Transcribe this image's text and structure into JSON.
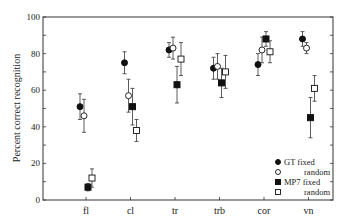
{
  "chart_data": {
    "type": "scatter",
    "title": "",
    "xlabel": "",
    "ylabel": "Percent correct recognition",
    "ylim": [
      0,
      100
    ],
    "yticks": [
      0,
      20,
      40,
      60,
      80,
      100
    ],
    "grid": false,
    "legend_position": "lower right",
    "categories": [
      "fl",
      "cl",
      "tr",
      "trb",
      "cor",
      "vn"
    ],
    "series": [
      {
        "name": "GT fixed",
        "marker": "filled-circle",
        "values": [
          51,
          75,
          82,
          72,
          74,
          88
        ],
        "err": [
          7,
          6,
          4,
          6,
          6,
          4
        ]
      },
      {
        "name": "random",
        "marker": "open-circle",
        "values": [
          46,
          57,
          83,
          73,
          82,
          83
        ],
        "err": [
          9,
          9,
          6,
          7,
          7,
          3
        ]
      },
      {
        "name": "MP7 fixed",
        "marker": "filled-square",
        "values": [
          7,
          51,
          63,
          64,
          88,
          45
        ],
        "err": [
          2,
          10,
          10,
          8,
          4,
          11
        ]
      },
      {
        "name": "random",
        "marker": "open-square",
        "values": [
          12,
          38,
          77,
          70,
          81,
          61
        ],
        "err": [
          5,
          6,
          9,
          9,
          6,
          7
        ]
      }
    ]
  }
}
